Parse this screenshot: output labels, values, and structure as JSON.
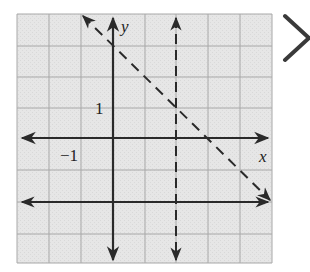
{
  "graph": {
    "x_axis_label": "x",
    "y_axis_label": "y",
    "tick_label_y": "1",
    "tick_label_x": "−1",
    "grid": {
      "x_min": -3,
      "x_max": 5,
      "y_min": -4,
      "y_max": 4,
      "step": 1
    },
    "lines": [
      {
        "name": "dashed-diagonal",
        "equation": "y = -x + 3",
        "style": "dashed"
      },
      {
        "name": "dashed-vertical",
        "equation": "x = 2",
        "style": "dashed"
      },
      {
        "name": "solid-horizontal",
        "equation": "y = -2",
        "style": "solid"
      }
    ],
    "colors": {
      "grid_bg": "#e4e4e4",
      "grid_line": "#a8a8a8",
      "ink": "#2a2a2a"
    }
  },
  "answer_mark": {
    "icon": "x-mark-icon"
  }
}
